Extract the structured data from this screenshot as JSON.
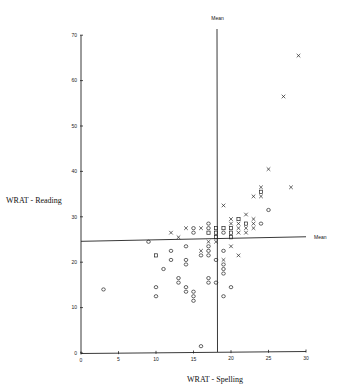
{
  "chart_data": {
    "type": "scatter",
    "title": "",
    "xlabel": "WRAT - Spelling",
    "ylabel": "WRAT - Reading",
    "xlim": [
      0,
      30
    ],
    "ylim": [
      0,
      70
    ],
    "x_ticks": [
      0,
      5,
      10,
      15,
      20,
      25,
      30
    ],
    "y_ticks": [
      0,
      10,
      20,
      30,
      40,
      50,
      60,
      70
    ],
    "grid": false,
    "legend": null,
    "reference_lines": [
      {
        "orientation": "vertical",
        "label": "Mean",
        "x": 18.2
      },
      {
        "orientation": "horizontal",
        "label": "Mean",
        "y_start": 24.6,
        "y_end": 25.6
      }
    ],
    "markers": {
      "circle": "o",
      "cross": "x",
      "square": "□"
    },
    "series": [
      {
        "name": "circle",
        "marker": "o",
        "points": [
          [
            3,
            14
          ],
          [
            9,
            24.5
          ],
          [
            10,
            14.5
          ],
          [
            10,
            12.5
          ],
          [
            11,
            18.5
          ],
          [
            12,
            22.5
          ],
          [
            12,
            20.5
          ],
          [
            13,
            16.5
          ],
          [
            13,
            15.5
          ],
          [
            14,
            23.5
          ],
          [
            14,
            20.5
          ],
          [
            14,
            19.5
          ],
          [
            14,
            14.5
          ],
          [
            14,
            13.5
          ],
          [
            15,
            27.5
          ],
          [
            15,
            26.5
          ],
          [
            15,
            13.5
          ],
          [
            15,
            12.5
          ],
          [
            15,
            11.5
          ],
          [
            16,
            21.5
          ],
          [
            16,
            1.5
          ],
          [
            17,
            28.5
          ],
          [
            17,
            27.5
          ],
          [
            17,
            23.5
          ],
          [
            17,
            22.5
          ],
          [
            17,
            21.5
          ],
          [
            17,
            16.5
          ],
          [
            17,
            15.5
          ],
          [
            18,
            20.5
          ],
          [
            18,
            15.5
          ],
          [
            19,
            26.5
          ],
          [
            19,
            22.5
          ],
          [
            19,
            19.5
          ],
          [
            19,
            18.5
          ],
          [
            19,
            17.5
          ],
          [
            19,
            12.5
          ],
          [
            20,
            14.5
          ],
          [
            24,
            28.5
          ],
          [
            25,
            31.5
          ]
        ]
      },
      {
        "name": "cross",
        "marker": "x",
        "points": [
          [
            12,
            26.5
          ],
          [
            13,
            25.5
          ],
          [
            14,
            27.5
          ],
          [
            16,
            27.5
          ],
          [
            16,
            22.5
          ],
          [
            17,
            24.5
          ],
          [
            18,
            24.5
          ],
          [
            19,
            32.5
          ],
          [
            19,
            20.5
          ],
          [
            20,
            29.5
          ],
          [
            20,
            28.5
          ],
          [
            20,
            23.5
          ],
          [
            21,
            28.5
          ],
          [
            21,
            27.5
          ],
          [
            21,
            26.5
          ],
          [
            21,
            21.5
          ],
          [
            22,
            30.5
          ],
          [
            22,
            27.5
          ],
          [
            22,
            26.5
          ],
          [
            23,
            34.5
          ],
          [
            23,
            29.5
          ],
          [
            23,
            28.5
          ],
          [
            23,
            27.5
          ],
          [
            24,
            36.5
          ],
          [
            24,
            34.5
          ],
          [
            25,
            40.5
          ],
          [
            27,
            56.5
          ],
          [
            28,
            36.5
          ],
          [
            29,
            65.5
          ]
        ]
      },
      {
        "name": "square",
        "marker": "square",
        "points": [
          [
            10,
            21.5
          ],
          [
            17,
            26.5
          ],
          [
            18,
            27.5
          ],
          [
            18,
            26.5
          ],
          [
            18,
            25.5
          ],
          [
            19,
            27.5
          ],
          [
            20,
            27.5
          ],
          [
            20,
            26.5
          ],
          [
            20,
            25.5
          ],
          [
            21,
            29.5
          ],
          [
            22,
            28.5
          ],
          [
            24,
            35.5
          ]
        ]
      }
    ]
  }
}
